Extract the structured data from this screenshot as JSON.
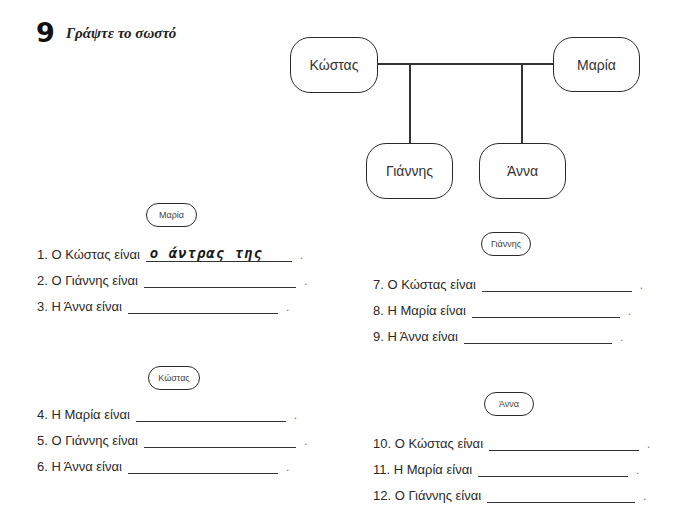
{
  "exercise": {
    "number": "9",
    "title": "Γράψτε το σωστό"
  },
  "family_tree": {
    "father": "Κώστας",
    "mother": "Μαρία",
    "children": [
      "Γιάννης",
      "Άννα"
    ]
  },
  "sections": [
    {
      "label": "Μαρία",
      "items": [
        {
          "prompt": "1. Ο Κώστας είναι",
          "answer": "ο άντρας της"
        },
        {
          "prompt": "2. Ο Γιάννης είναι",
          "answer": ""
        },
        {
          "prompt": "3. Η Άννα είναι",
          "answer": ""
        }
      ]
    },
    {
      "label": "Κώστας",
      "items": [
        {
          "prompt": "4. Η Μαρία είναι",
          "answer": ""
        },
        {
          "prompt": "5. Ο Γιάννης είναι",
          "answer": ""
        },
        {
          "prompt": "6. Η Άννα είναι",
          "answer": ""
        }
      ]
    },
    {
      "label": "Γιάννης",
      "items": [
        {
          "prompt": "7. Ο Κώστας είναι",
          "answer": ""
        },
        {
          "prompt": "8. Η Μαρία είναι",
          "answer": ""
        },
        {
          "prompt": "9. Η Άννα είναι",
          "answer": ""
        }
      ]
    },
    {
      "label": "Άννα",
      "items": [
        {
          "prompt": "10. Ο Κώστας είναι",
          "answer": ""
        },
        {
          "prompt": "11. Η Μαρία είναι",
          "answer": ""
        },
        {
          "prompt": "12. Ο Γιάννης είναι",
          "answer": ""
        }
      ]
    }
  ],
  "punctuation": "."
}
